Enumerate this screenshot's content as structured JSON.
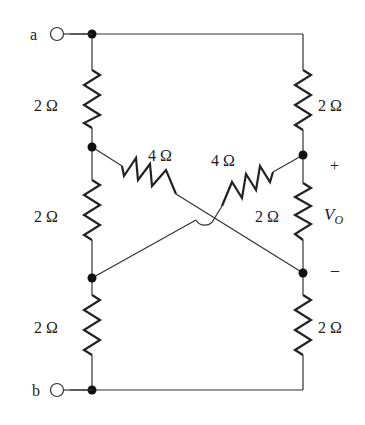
{
  "diagram": {
    "type": "resistor-circuit",
    "terminals": [
      {
        "id": "a",
        "label": "a"
      },
      {
        "id": "b",
        "label": "b"
      }
    ],
    "resistors": [
      {
        "id": "R_left_top",
        "label": "2 Ω",
        "value_ohms": 2
      },
      {
        "id": "R_left_mid",
        "label": "2 Ω",
        "value_ohms": 2
      },
      {
        "id": "R_left_bot",
        "label": "2 Ω",
        "value_ohms": 2
      },
      {
        "id": "R_right_top",
        "label": "2 Ω",
        "value_ohms": 2
      },
      {
        "id": "R_right_mid",
        "label": "2 Ω",
        "value_ohms": 2
      },
      {
        "id": "R_right_bot",
        "label": "2 Ω",
        "value_ohms": 2
      },
      {
        "id": "R_diag_left",
        "label": "4 Ω",
        "value_ohms": 4
      },
      {
        "id": "R_diag_right",
        "label": "4 Ω",
        "value_ohms": 4
      }
    ],
    "output": {
      "label_main": "V",
      "label_sub": "O",
      "plus": "+",
      "minus": "–"
    }
  }
}
